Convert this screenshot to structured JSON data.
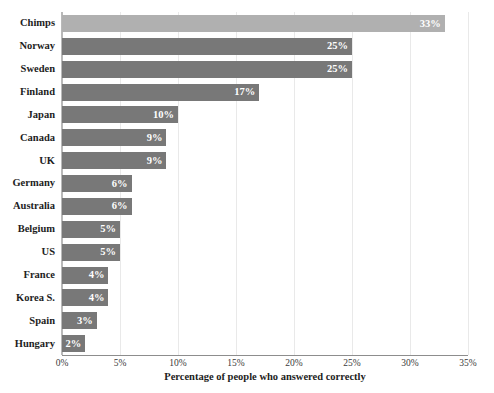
{
  "chart_data": {
    "type": "bar",
    "orientation": "horizontal",
    "title": "",
    "title_note": "title is cropped off the top edge of the screenshot and is not legible",
    "xlabel": "Percentage of people who answered correctly",
    "ylabel": "",
    "xlim": [
      0,
      35
    ],
    "xtick_labels": [
      "0%",
      "5%",
      "10%",
      "15%",
      "20%",
      "25%",
      "30%",
      "35%"
    ],
    "xtick_values": [
      0,
      5,
      10,
      15,
      20,
      25,
      30,
      35
    ],
    "grid": true,
    "grid_axis": "x",
    "legend": false,
    "categories": [
      "Chimps",
      "Norway",
      "Sweden",
      "Finland",
      "Japan",
      "Canada",
      "UK",
      "Germany",
      "Australia",
      "Belgium",
      "US",
      "France",
      "Korea S.",
      "Spain",
      "Hungary"
    ],
    "values": [
      33,
      25,
      25,
      17,
      10,
      9,
      9,
      6,
      6,
      5,
      5,
      4,
      4,
      3,
      2
    ],
    "value_labels": [
      "33%",
      "25%",
      "25%",
      "17%",
      "10%",
      "9%",
      "9%",
      "6%",
      "6%",
      "5%",
      "5%",
      "4%",
      "4%",
      "3%",
      "2%"
    ],
    "bars": [
      {
        "category": "Chimps",
        "value": 33,
        "label": "33%",
        "highlight": true
      },
      {
        "category": "Norway",
        "value": 25,
        "label": "25%",
        "highlight": false
      },
      {
        "category": "Sweden",
        "value": 25,
        "label": "25%",
        "highlight": false
      },
      {
        "category": "Finland",
        "value": 17,
        "label": "17%",
        "highlight": false
      },
      {
        "category": "Japan",
        "value": 10,
        "label": "10%",
        "highlight": false
      },
      {
        "category": "Canada",
        "value": 9,
        "label": "9%",
        "highlight": false
      },
      {
        "category": "UK",
        "value": 9,
        "label": "9%",
        "highlight": false
      },
      {
        "category": "Germany",
        "value": 6,
        "label": "6%",
        "highlight": false
      },
      {
        "category": "Australia",
        "value": 6,
        "label": "6%",
        "highlight": false
      },
      {
        "category": "Belgium",
        "value": 5,
        "label": "5%",
        "highlight": false
      },
      {
        "category": "US",
        "value": 5,
        "label": "5%",
        "highlight": false
      },
      {
        "category": "France",
        "value": 4,
        "label": "4%",
        "highlight": false
      },
      {
        "category": "Korea S.",
        "value": 4,
        "label": "4%",
        "highlight": false
      },
      {
        "category": "Spain",
        "value": 3,
        "label": "3%",
        "highlight": false
      },
      {
        "category": "Hungary",
        "value": 2,
        "label": "2%",
        "highlight": false
      }
    ],
    "colors": {
      "bar": "#787878",
      "bar_highlight": "#b0b0b0",
      "value_label": "#ffffff",
      "grid": "#e9e9e9",
      "axis": "#8d8d8d",
      "background": "#ffffff",
      "text": "#1d1d1d"
    }
  }
}
